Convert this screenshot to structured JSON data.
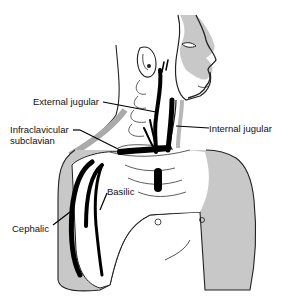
{
  "diagram": {
    "labels": {
      "external_jugular": "External jugular",
      "internal_jugular": "Internal jugular",
      "infraclavicular_line1": "Infraclavicular",
      "infraclavicular_line2": "subclavian",
      "basilic": "Basilic",
      "cephalic": "Cephalic"
    },
    "colors": {
      "skin_fill": "#c8c8c8",
      "outline": "#222222",
      "vein": "#000000",
      "background": "#ffffff"
    }
  }
}
